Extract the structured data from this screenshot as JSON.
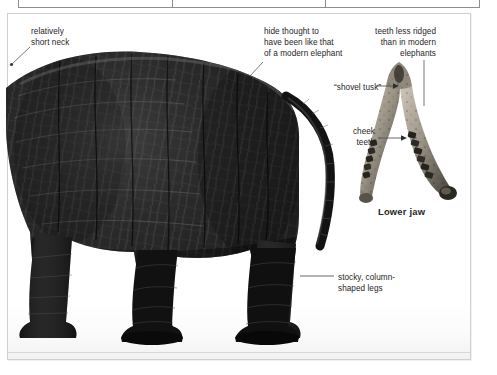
{
  "figure": {
    "callouts": [
      {
        "id": "neck",
        "text": "relatively\nshort neck"
      },
      {
        "id": "hide",
        "text": "hide thought to\nhave been like that\nof a modern elephant"
      },
      {
        "id": "teeth",
        "text": "teeth less ridged\nthan in modern\nelephants"
      },
      {
        "id": "tusk",
        "text": "“shovel tusk”"
      },
      {
        "id": "cheek",
        "text": "cheek\nteeth"
      },
      {
        "id": "legs",
        "text": "stocky, column-\nshaped legs"
      }
    ],
    "inset_caption": "Lower jaw"
  },
  "top_strip": {
    "cells": [
      "",
      "",
      ""
    ]
  },
  "colors": {
    "body_dark": "#1b1b1b",
    "body_mid": "#3a3a3a",
    "fossil_light": "#b9b2a6",
    "fossil_dark": "#4a463f",
    "text": "#262626",
    "leader": "#5a5a5a",
    "frame": "#cfcfcf"
  }
}
